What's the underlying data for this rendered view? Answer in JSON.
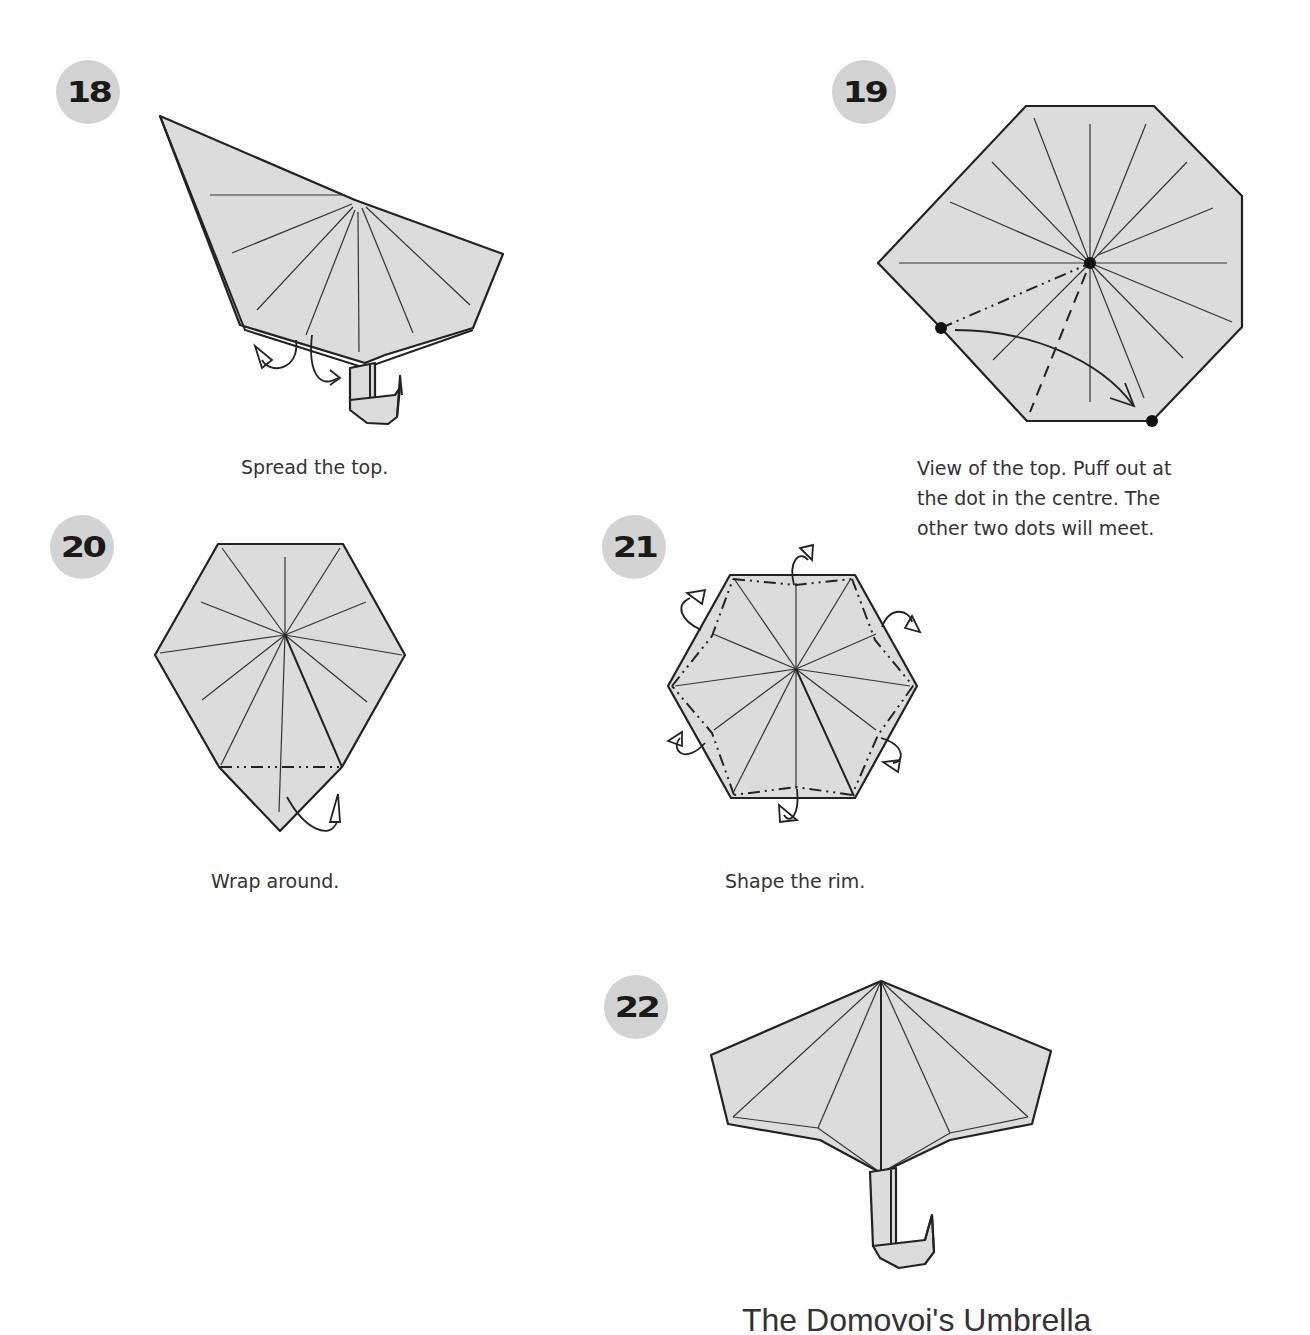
{
  "steps": [
    {
      "number": "18",
      "caption": "Spread the top."
    },
    {
      "number": "19",
      "caption_lines": [
        "View of the top. Puff out at",
        "the dot in the centre. The",
        "other two dots will meet."
      ]
    },
    {
      "number": "20",
      "caption": "Wrap around."
    },
    {
      "number": "21",
      "caption": "Shape the rim."
    },
    {
      "number": "22",
      "caption": "The Domovoi's Umbrella"
    }
  ],
  "colors": {
    "badge_bg": "#d3d3d3",
    "paper_fill": "#dcdcdc",
    "line": "#222222",
    "text": "#333333"
  }
}
